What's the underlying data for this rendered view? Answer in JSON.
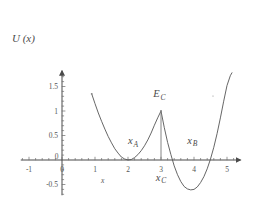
{
  "figure": {
    "kind": "line-plot",
    "background_color": "#ffffff",
    "ink_color": "#555555"
  },
  "axes": {
    "y_axis_title": "U (x)",
    "x_axis_title": "x",
    "x_ticks": [
      {
        "value": -1,
        "label": "-1"
      },
      {
        "value": 0,
        "label": "0"
      },
      {
        "value": 1,
        "label": "1"
      },
      {
        "value": 2,
        "label": "2"
      },
      {
        "value": 3,
        "label": "3"
      },
      {
        "value": 4,
        "label": "4"
      },
      {
        "value": 5,
        "label": "5"
      }
    ],
    "y_ticks": [
      {
        "value": 1.5,
        "label": "1.5"
      },
      {
        "value": 1.0,
        "label": "1"
      },
      {
        "value": 0.5,
        "label": "0.5"
      },
      {
        "value": 0.0,
        "label": "0"
      },
      {
        "value": -0.5,
        "label": "-0.5"
      }
    ],
    "minor_tick_step_x": 0.2,
    "minor_tick_step_y": 0.1,
    "x_arrow": true,
    "y_arrow": true
  },
  "annotations": [
    {
      "id": "xA",
      "base": "x",
      "subscript": "A",
      "x": 2.15,
      "y": 0.32
    },
    {
      "id": "EC",
      "base": "E",
      "subscript": "C",
      "x": 2.95,
      "y": 1.28
    },
    {
      "id": "xB",
      "base": "x",
      "subscript": "B",
      "x": 3.95,
      "y": 0.33
    },
    {
      "id": "xC",
      "base": "x",
      "subscript": "C",
      "x": 3.0,
      "y": -0.42
    }
  ],
  "chart_data": {
    "type": "line",
    "title": "",
    "xlabel": "x",
    "ylabel": "U (x)",
    "xlim": [
      -1.25,
      5.35
    ],
    "ylim": [
      -0.78,
      1.78
    ],
    "grid": false,
    "legend": null,
    "series": [
      {
        "name": "U(x) left well",
        "comment": "left parabolic well, minimum at x_A",
        "x": [
          0.9,
          1.0,
          1.1,
          1.2,
          1.3,
          1.4,
          1.5,
          1.6,
          1.7,
          1.8,
          1.9,
          2.0,
          2.1,
          2.2,
          2.3,
          2.4,
          2.5,
          2.6,
          2.7,
          2.8,
          2.9,
          3.0
        ],
        "y": [
          1.35,
          1.15,
          0.96,
          0.79,
          0.63,
          0.48,
          0.35,
          0.23,
          0.14,
          0.06,
          0.02,
          0.0,
          0.01,
          0.05,
          0.11,
          0.19,
          0.29,
          0.41,
          0.55,
          0.71,
          0.86,
          1.0
        ]
      },
      {
        "name": "U(x) right well",
        "comment": "right parabolic well, minimum at x_B, starts at cusp E_C",
        "x": [
          3.0,
          3.1,
          3.2,
          3.3,
          3.4,
          3.5,
          3.6,
          3.7,
          3.8,
          3.9,
          4.0,
          4.1,
          4.2,
          4.3,
          4.4,
          4.5,
          4.6,
          4.7,
          4.8,
          4.9,
          5.0,
          5.1,
          5.15
        ],
        "y": [
          1.0,
          0.66,
          0.36,
          0.11,
          -0.12,
          -0.3,
          -0.44,
          -0.54,
          -0.59,
          -0.61,
          -0.6,
          -0.55,
          -0.46,
          -0.34,
          -0.18,
          0.02,
          0.26,
          0.54,
          0.86,
          1.2,
          1.52,
          1.72,
          1.78
        ]
      }
    ],
    "markers": [
      {
        "name": "cusp-peak",
        "x": 3.0,
        "y": 1.0,
        "label": "E_C"
      },
      {
        "name": "left-well-minimum",
        "x": 2.0,
        "y": 0.0,
        "label": "x_A"
      },
      {
        "name": "right-well-minimum",
        "x": 3.95,
        "y": -0.61,
        "label": "x_B"
      },
      {
        "name": "cusp-foot",
        "x": 3.0,
        "y": 0.0,
        "label": "x_C"
      }
    ],
    "vertical_lines": [
      {
        "name": "cusp-drop-line",
        "x": 3.0,
        "y_from": 0.0,
        "y_to": 1.0
      }
    ]
  }
}
